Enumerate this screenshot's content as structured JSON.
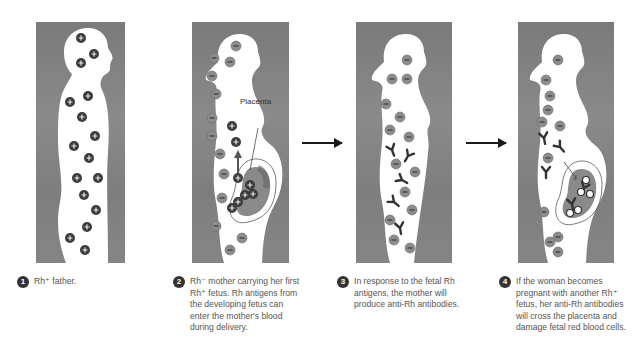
{
  "figure": {
    "panels": [
      {
        "id": 1,
        "subject": "Rh+ father",
        "cells": "rh-positive"
      },
      {
        "id": 2,
        "subject": "Rh- mother with first Rh+ fetus",
        "cells": "rh-negative",
        "label": "Placenta"
      },
      {
        "id": 3,
        "subject": "Rh- mother producing anti-Rh antibodies",
        "cells": "rh-negative"
      },
      {
        "id": 4,
        "subject": "Rh- mother with second Rh+ fetus",
        "cells": "rh-negative"
      }
    ],
    "placenta_label": "Placenta",
    "arrows": [
      "step-3-arrow",
      "step-4-arrow"
    ],
    "colors": {
      "background": "#808080",
      "silhouette": "#ffffff",
      "rh_positive_cell": "#3c3c3c",
      "rh_negative_cell": "#8c8c8c",
      "antibody": "#333333",
      "placenta": "#9a9a9a"
    }
  },
  "captions": [
    {
      "num": "1",
      "text": "Rh⁺ father."
    },
    {
      "num": "2",
      "text": "Rh⁻ mother carrying her first Rh⁺ fetus. Rh antigens from the developing fetus can enter the mother's blood during delivery."
    },
    {
      "num": "3",
      "text": "In response to the fetal Rh antigens, the mother will produce anti-Rh antibodies."
    },
    {
      "num": "4",
      "text": "If the woman becomes pregnant with another Rh⁺ fetus, her anti-Rh antibodies will cross the placenta and damage fetal red blood cells."
    }
  ]
}
